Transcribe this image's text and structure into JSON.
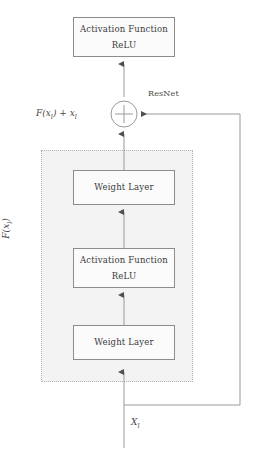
{
  "diagram": {
    "type": "flowchart",
    "colors": {
      "box_border": "#8c8c8c",
      "box_fill": "#fbfbfb",
      "region_border": "#b5b5b5",
      "region_fill": "#f3f3f3",
      "arrow": "#8c8c8c",
      "text": "#3a3a3a"
    },
    "nodes": [
      {
        "id": "activation-top",
        "line1": "Activation Function",
        "line2": "ReLU"
      },
      {
        "id": "weight-upper",
        "line1": "Weight Layer",
        "line2": ""
      },
      {
        "id": "activation-mid",
        "line1": "Activation Function",
        "line2": "ReLU"
      },
      {
        "id": "weight-lower",
        "line1": "Weight Layer",
        "line2": ""
      }
    ],
    "operator": {
      "symbol": "+",
      "name": "addition-node"
    },
    "labels": {
      "sum_output": "F(x",
      "sum_output_sub": "l",
      "sum_output_tail": ") + x",
      "sum_output_sub2": "l",
      "skip_connection": "ResNet",
      "input": "X",
      "input_sub": "l",
      "residual_function": "F(x",
      "residual_function_sub": "l",
      "residual_function_tail": ")"
    }
  }
}
